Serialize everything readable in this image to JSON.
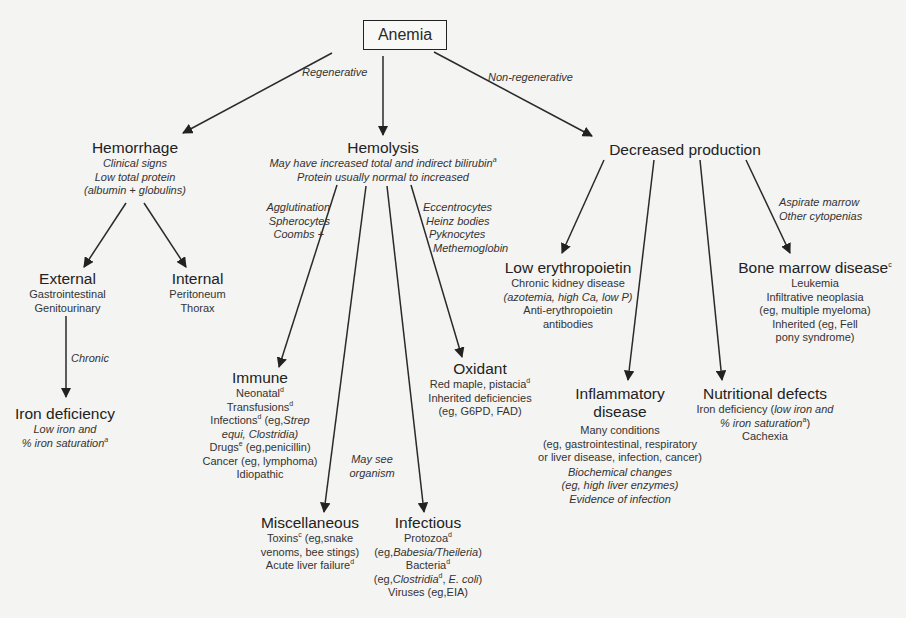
{
  "diagram": {
    "root": {
      "label": "Anemia"
    },
    "edge_labels": {
      "regenerative": "Regenerative",
      "non_regenerative": "Non-regenerative",
      "chronic": "Chronic",
      "immune_criteria": [
        "Agglutination",
        "Spherocytes",
        "Coombs +"
      ],
      "oxidant_criteria": [
        "Eccentrocytes",
        "Heinz bodies",
        "Pyknocytes",
        "Methemoglobin"
      ],
      "infectious_criteria": [
        "May see",
        "organism"
      ],
      "bone_marrow_criteria": [
        "Aspirate marrow",
        "Other cytopenias"
      ]
    },
    "nodes": {
      "hemorrhage": {
        "title": "Hemorrhage",
        "lines": [
          "Clinical signs",
          "Low total protein",
          "(albumin + globulins)"
        ]
      },
      "hemolysis": {
        "title": "Hemolysis",
        "lines": [
          "May have increased total and indirect bilirubin",
          "Protein usually normal to increased"
        ],
        "sup": "a"
      },
      "decreased_production": {
        "title": "Decreased production"
      },
      "external": {
        "title": "External",
        "lines": [
          "Gastrointestinal",
          "Genitourinary"
        ]
      },
      "internal": {
        "title": "Internal",
        "lines": [
          "Peritoneum",
          "Thorax"
        ]
      },
      "iron_deficiency": {
        "title": "Iron deficiency",
        "lines": [
          "Low iron and",
          "% iron saturation"
        ],
        "sup": "a"
      },
      "immune": {
        "title": "Immune",
        "lines": [
          {
            "text": "Neonatal",
            "sup": "d"
          },
          {
            "text": "Transfusions",
            "sup": "d"
          },
          {
            "text": "Infections",
            "sup": "d",
            "rest": " (eg,",
            "italic": "Strep"
          },
          {
            "italic": "equi, Clostridia)"
          },
          {
            "text": "Drugs",
            "sup": "e",
            "rest": " (eg,penicillin)"
          },
          {
            "text": "Cancer (eg, lymphoma)"
          },
          {
            "text": "Idiopathic"
          }
        ]
      },
      "oxidant": {
        "title": "Oxidant",
        "lines": [
          {
            "text": "Red maple, pistacia",
            "sup": "d"
          },
          {
            "text": "Inherited deficiencies"
          },
          {
            "text": "(eg, G6PD, FAD)"
          }
        ]
      },
      "miscellaneous": {
        "title": "Miscellaneous",
        "lines": [
          {
            "text": "Toxins",
            "sup": "c",
            "rest": " (eg,snake"
          },
          {
            "text": "venoms, bee stings)"
          },
          {
            "text": "Acute liver failure",
            "sup": "d"
          }
        ]
      },
      "infectious": {
        "title": "Infectious",
        "lines": [
          {
            "text": "Protozoa",
            "sup": "d"
          },
          {
            "text": "(eg,",
            "italic": "Babesia/Theileria",
            "rest": ")"
          },
          {
            "text": "Bacteria",
            "sup": "d"
          },
          {
            "text": "(eg,",
            "italic": "Clostridia",
            "sup": "d",
            "rest2": ", ",
            "italic2": "E. coli",
            "rest": ")"
          },
          {
            "text": "Viruses (eg,EIA)"
          }
        ]
      },
      "low_erythropoietin": {
        "title": "Low erythropoietin",
        "lines": [
          "Chronic kidney disease",
          "(azotemia, high Ca, low P)",
          "Anti-erythropoietin",
          "antibodies"
        ]
      },
      "bone_marrow_disease": {
        "title": "Bone marrow disease",
        "sup": "c",
        "lines": [
          "Leukemia",
          "Infiltrative neoplasia",
          "(eg, multiple myeloma)",
          "Inherited (eg, Fell",
          "pony syndrome)"
        ]
      },
      "inflammatory_disease": {
        "title_lines": [
          "Inflammatory",
          "disease"
        ],
        "lines": [
          "Many conditions",
          "(eg, gastrointestinal, respiratory",
          "or liver disease, infection, cancer)"
        ],
        "italic_lines": [
          "Biochemical changes",
          "(eg, high liver enzymes)",
          "Evidence of infection"
        ]
      },
      "nutritional_defects": {
        "title": "Nutritional defects",
        "line1_plain": "Iron deficiency (",
        "line1_italic": "low iron and",
        "line2_italic": "% iron saturation",
        "line2_sup": "a",
        "line2_rest": ")",
        "line3": "Cachexia"
      }
    }
  }
}
